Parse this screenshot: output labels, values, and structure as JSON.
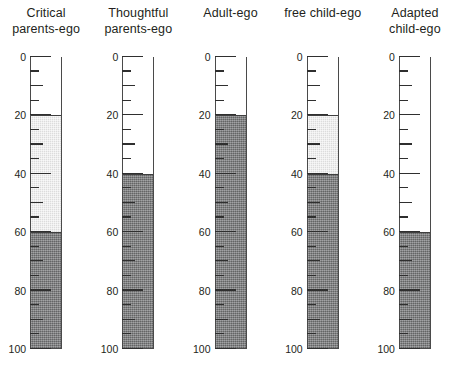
{
  "chart_data": {
    "type": "bar",
    "title": "",
    "subtitle": "",
    "xlabel": "",
    "ylabel": "",
    "ylim": [
      0,
      100
    ],
    "grid": false,
    "legend": "none",
    "orientation": "vertical",
    "style": "thermometer-gauge-columns",
    "y_ticks_major": [
      0,
      20,
      40,
      60,
      80,
      100
    ],
    "y_ticks_minor_step": 5,
    "y_tick_labels": [
      "0",
      "20",
      "40",
      "60",
      "80",
      "100"
    ],
    "categories": [
      "Critical parents-ego",
      "Thoughtful parents-ego",
      "Adult-ego",
      "free child-ego",
      "Adapted child-ego"
    ],
    "series": [
      {
        "name": "primary-dark-fill",
        "color": "#78797b",
        "values": [
          40,
          60,
          80,
          60,
          40
        ]
      },
      {
        "name": "secondary-light-fill",
        "color": "#dcdcdc",
        "values": [
          80,
          60,
          80,
          80,
          40
        ]
      }
    ]
  },
  "panels": [
    {
      "title": "Critical\nparents-ego",
      "dark_value": 40,
      "light_value": 80,
      "tick_labels": [
        "100",
        "80",
        "60",
        "40",
        "20",
        "0"
      ]
    },
    {
      "title": "Thoughtful\nparents-ego",
      "dark_value": 60,
      "light_value": 60,
      "tick_labels": [
        "100",
        "80",
        "60",
        "40",
        "20",
        "0"
      ]
    },
    {
      "title": "Adult-ego",
      "dark_value": 80,
      "light_value": 80,
      "tick_labels": [
        "100",
        "80",
        "60",
        "40",
        "20",
        "0"
      ]
    },
    {
      "title": "free child-ego",
      "dark_value": 60,
      "light_value": 80,
      "tick_labels": [
        "100",
        "80",
        "60",
        "40",
        "20",
        "0"
      ]
    },
    {
      "title": "Adapted\nchild-ego",
      "dark_value": 40,
      "light_value": 40,
      "tick_labels": [
        "100",
        "80",
        "60",
        "40",
        "20",
        "0"
      ]
    }
  ],
  "colors": {
    "primary_fill": "#78797b",
    "secondary_fill": "#dcdcdc",
    "tube_outline": "#4a4a4a",
    "tick": "#2f2f2f",
    "text": "#231f20",
    "background": "#ffffff"
  }
}
